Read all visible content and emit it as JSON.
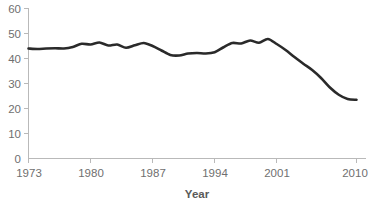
{
  "chart_data": {
    "type": "line",
    "title": "",
    "subtitle": "",
    "xlabel": "Year",
    "ylabel": "",
    "xlim": [
      1973,
      2010
    ],
    "ylim": [
      0,
      60
    ],
    "grid": false,
    "legend": "none",
    "x_ticks": [
      1973,
      1980,
      1987,
      1994,
      2001,
      2010
    ],
    "y_ticks": [
      0,
      10,
      20,
      30,
      40,
      50,
      60
    ],
    "line_color": "#2a2a2a",
    "axis_color": "#b9b9b9",
    "label_color": "#6f6f6f",
    "series": [
      {
        "name": "series-1",
        "x": [
          1973,
          1974,
          1975,
          1976,
          1977,
          1978,
          1979,
          1980,
          1981,
          1982,
          1983,
          1984,
          1985,
          1986,
          1987,
          1988,
          1989,
          1990,
          1991,
          1992,
          1993,
          1994,
          1995,
          1996,
          1997,
          1998,
          1999,
          2000,
          2001,
          2002,
          2003,
          2004,
          2005,
          2006,
          2007,
          2008,
          2009,
          2010
        ],
        "values": [
          44.0,
          43.8,
          44.0,
          44.1,
          44.0,
          44.6,
          45.9,
          45.6,
          46.4,
          45.2,
          45.6,
          44.3,
          45.3,
          46.2,
          45.0,
          43.2,
          41.4,
          41.2,
          42.0,
          42.2,
          42.0,
          42.5,
          44.5,
          46.2,
          46.0,
          47.2,
          46.3,
          47.8,
          45.8,
          43.4,
          40.6,
          37.9,
          35.4,
          32.2,
          28.4,
          25.5,
          23.8,
          23.5
        ]
      }
    ],
    "annotations": []
  },
  "axis": {
    "y_tick_labels": [
      "60",
      "50",
      "40",
      "30",
      "20",
      "10",
      "0"
    ],
    "x_tick_labels": [
      "1973",
      "1980",
      "1987",
      "1994",
      "2001",
      "2010"
    ],
    "x_axis_title": "Year"
  }
}
